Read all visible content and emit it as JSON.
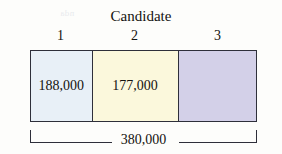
{
  "chart_data": {
    "type": "bar",
    "orientation": "horizontal-stacked",
    "title": "Candidate",
    "xlabel": "",
    "ylabel": "",
    "categories": [
      "1",
      "2",
      "3"
    ],
    "values": [
      188000,
      177000,
      15000
    ],
    "value_labels": [
      "188,000",
      "177,000",
      ""
    ],
    "total": 380000,
    "total_label": "380,000",
    "segment_colors": [
      "#e8f0f7",
      "#fbf8dc",
      "#d3d0e8"
    ],
    "segment_widths_pct": [
      26.9,
      38.3,
      34.8
    ],
    "grid": false,
    "legend": false,
    "annotations": [
      "380,000 total bracket spanning full bar width"
    ]
  },
  "figure": {
    "title": "Candidate",
    "border_color": "#2e2f3a",
    "background": "#fdfdfb",
    "text_color": "#14120f"
  },
  "categories": [
    {
      "label": "1",
      "value_label": "188,000",
      "color": "#e8f0f7"
    },
    {
      "label": "2",
      "value_label": "177,000",
      "color": "#fbf8dc"
    },
    {
      "label": "3",
      "value_label": "",
      "color": "#d3d0e8"
    }
  ],
  "total": {
    "label": "380,000"
  },
  "ghost_text": {
    "a": "the mean we",
    "b": "a the data",
    "c": "3011",
    "d": "17171",
    "e": "ano",
    "f": "(88",
    "g": "dure",
    "h": "nda"
  }
}
